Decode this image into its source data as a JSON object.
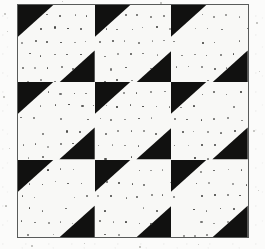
{
  "figure": {
    "medium": "scanned black-and-white line art",
    "frame": {
      "left": 17,
      "top": 4,
      "width": 232,
      "height": 234,
      "border_color": "#595b5a",
      "border_width": 1
    },
    "background_color": "#fbfbfa",
    "ink_color": "#111110",
    "paper_color": "#f8f8f6"
  },
  "grid": {
    "rows": 3,
    "columns": 3,
    "tile_count": 9,
    "tile_width": 77,
    "tile_height": 78,
    "row_boundaries_y": [
      4,
      82,
      160,
      238
    ],
    "column_boundaries_x": [
      17,
      94,
      171,
      248
    ]
  },
  "tile": {
    "name": "diagonal-band-tile",
    "fill_color": "#f8f8f6",
    "ink_color": "#111110",
    "band_direction": "lower-left to upper-right",
    "corner_triangles": [
      {
        "name": "upper-left-triangle",
        "points_percent": [
          [
            0,
            0
          ],
          [
            46,
            0
          ],
          [
            0,
            41
          ]
        ]
      },
      {
        "name": "lower-right-triangle",
        "points_percent": [
          [
            100,
            59
          ],
          [
            100,
            100
          ],
          [
            54,
            100
          ]
        ]
      }
    ],
    "white_band_points_percent": [
      [
        46,
        0
      ],
      [
        100,
        0
      ],
      [
        100,
        59
      ],
      [
        54,
        100
      ],
      [
        0,
        100
      ],
      [
        0,
        41
      ]
    ],
    "dot_texture": {
      "enabled": true,
      "dot_color": "#3a3a38",
      "dot_diameter_px": 1.6,
      "spacing_x_px": 13,
      "spacing_y_px": 13,
      "row_offset_px": 6.5,
      "jitter_px": 1.6
    }
  },
  "tiles": [
    {
      "row": 0,
      "column": 0,
      "name": "tile-r1c1",
      "orientation": "band-lower-left-to-upper-right"
    },
    {
      "row": 0,
      "column": 1,
      "name": "tile-r1c2",
      "orientation": "band-lower-left-to-upper-right"
    },
    {
      "row": 0,
      "column": 2,
      "name": "tile-r1c3",
      "orientation": "band-lower-left-to-upper-right"
    },
    {
      "row": 1,
      "column": 0,
      "name": "tile-r2c1",
      "orientation": "band-lower-left-to-upper-right"
    },
    {
      "row": 1,
      "column": 1,
      "name": "tile-r2c2",
      "orientation": "band-lower-left-to-upper-right"
    },
    {
      "row": 1,
      "column": 2,
      "name": "tile-r2c3",
      "orientation": "band-lower-left-to-upper-right"
    },
    {
      "row": 2,
      "column": 0,
      "name": "tile-r3c1",
      "orientation": "band-lower-left-to-upper-right"
    },
    {
      "row": 2,
      "column": 1,
      "name": "tile-r3c2",
      "orientation": "band-lower-left-to-upper-right"
    },
    {
      "row": 2,
      "column": 2,
      "name": "tile-r3c3",
      "orientation": "band-lower-left-to-upper-right"
    }
  ],
  "scan_artifacts": {
    "flecks": [
      {
        "x": 4,
        "y": 13,
        "size": 2.0
      },
      {
        "x": 7,
        "y": 31,
        "size": 1.4
      },
      {
        "x": 3,
        "y": 96,
        "size": 1.6
      },
      {
        "x": 9,
        "y": 148,
        "size": 1.3
      },
      {
        "x": 5,
        "y": 205,
        "size": 1.7
      },
      {
        "x": 256,
        "y": 22,
        "size": 1.5
      },
      {
        "x": 259,
        "y": 71,
        "size": 1.3
      },
      {
        "x": 253,
        "y": 130,
        "size": 1.8
      },
      {
        "x": 258,
        "y": 190,
        "size": 1.4
      },
      {
        "x": 31,
        "y": 245,
        "size": 1.5
      },
      {
        "x": 84,
        "y": 243,
        "size": 1.3
      },
      {
        "x": 139,
        "y": 246,
        "size": 1.6
      },
      {
        "x": 198,
        "y": 244,
        "size": 1.4
      },
      {
        "x": 62,
        "y": 1,
        "size": 1.3
      },
      {
        "x": 160,
        "y": 2,
        "size": 1.5
      }
    ]
  }
}
